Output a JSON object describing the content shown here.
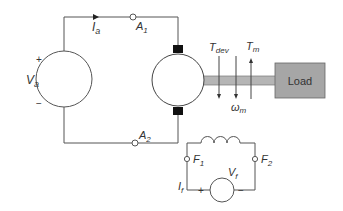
{
  "diagram": {
    "armature_source": {
      "label_main": "V",
      "label_sub": "a",
      "plus": "+",
      "minus": "−"
    },
    "armature_current": {
      "label_main": "I",
      "label_sub": "a"
    },
    "terminals": {
      "a1": {
        "label_main": "A",
        "label_sub": "1"
      },
      "a2": {
        "label_main": "A",
        "label_sub": "2"
      },
      "f1": {
        "label_main": "F",
        "label_sub": "1"
      },
      "f2": {
        "label_main": "F",
        "label_sub": "2"
      }
    },
    "torques": {
      "developed": {
        "label_main": "T",
        "label_sub": "dev"
      },
      "mechanical": {
        "label_main": "T",
        "label_sub": "m"
      }
    },
    "speed": {
      "label_main": "ω",
      "label_sub": "m"
    },
    "load": {
      "label": "Load"
    },
    "field_source": {
      "label_main": "V",
      "label_sub": "f",
      "plus": "+",
      "minus": "−"
    },
    "field_current": {
      "label_main": "I",
      "label_sub": "f"
    },
    "colors": {
      "wire": "#555555",
      "shaft": "#b5b5b5",
      "load_fill": "#a6a6a6",
      "brush": "#111111"
    }
  }
}
